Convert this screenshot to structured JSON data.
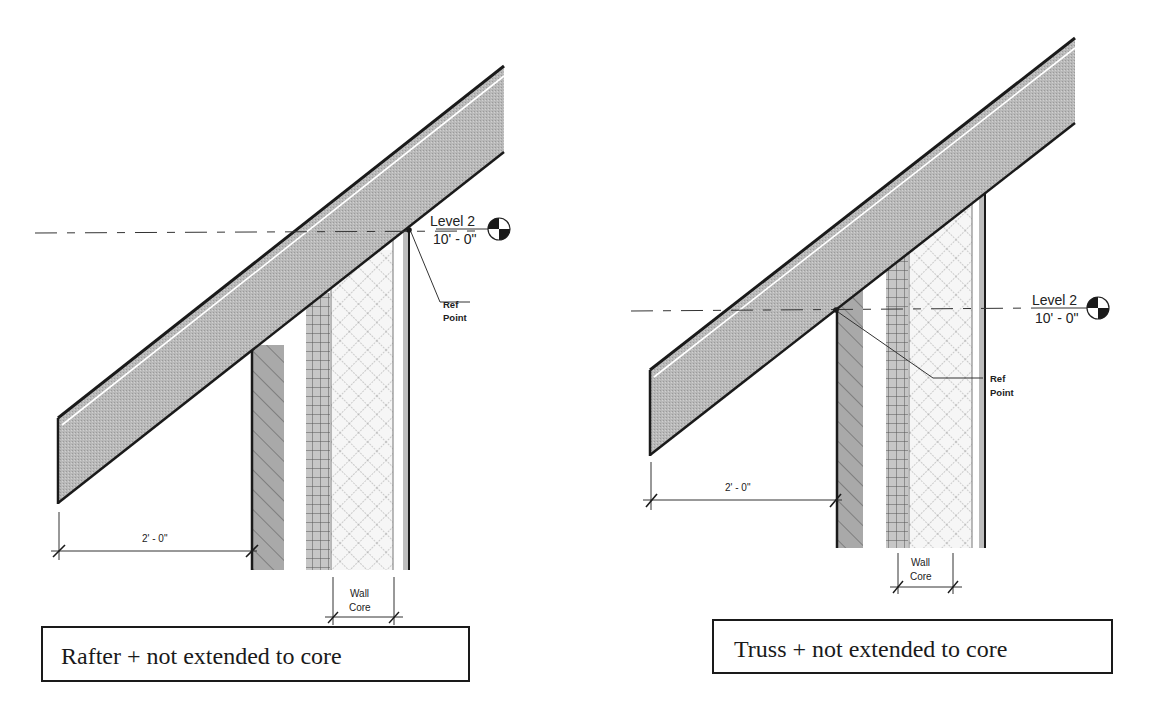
{
  "diagrams": [
    {
      "id": "rafter",
      "caption": "Rafter + not extended to core",
      "level": {
        "name": "Level 2",
        "elevation": "10' - 0\""
      },
      "ref_label_line1": "Ref",
      "ref_label_line2": "Point",
      "overhang_dimension": "2' - 0\"",
      "core_label_line1": "Wall",
      "core_label_line2": "Core"
    },
    {
      "id": "truss",
      "caption": "Truss + not extended to core",
      "level": {
        "name": "Level 2",
        "elevation": "10' - 0\""
      },
      "ref_label_line1": "Ref",
      "ref_label_line2": "Point",
      "overhang_dimension": "2' - 0\"",
      "core_label_line1": "Wall",
      "core_label_line2": "Core"
    }
  ],
  "colors": {
    "roof_fill": "#b8b8b8",
    "line": "#1a1a1a",
    "hatch_fill": "#a8a8a8",
    "grid_fill": "#c4c4c4",
    "insulation_fill": "#f4f4f4"
  }
}
